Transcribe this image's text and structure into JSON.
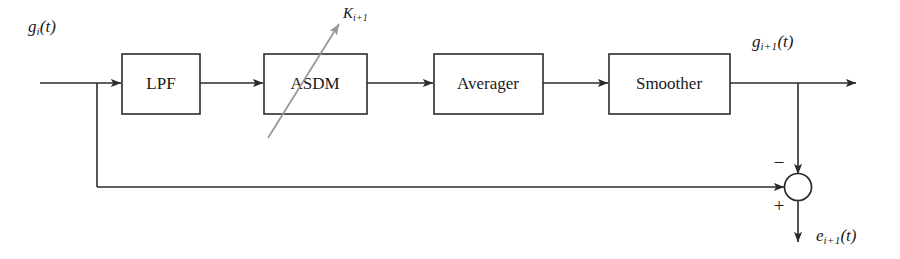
{
  "diagram": {
    "background_color": "#ffffff",
    "line_color": "#2b2b2b",
    "gain_arrow_color": "#9a9a9a",
    "blocks": [
      {
        "id": "lpf",
        "label": "LPF"
      },
      {
        "id": "asdm",
        "label": "ASDM"
      },
      {
        "id": "averager",
        "label": "Averager"
      },
      {
        "id": "smoother",
        "label": "Smoother"
      }
    ],
    "signals": {
      "input": {
        "base": "g",
        "sub": "i",
        "arg": "(t)"
      },
      "output": {
        "base": "g",
        "sub": "i+1",
        "arg": "(t)"
      },
      "error": {
        "base": "e",
        "sub": "i+1",
        "arg": "(t)"
      },
      "gain": {
        "base": "K",
        "sub": "i+1",
        "arg": ""
      }
    },
    "summing_junction": {
      "name": "summing-junction",
      "minus_sign": "−",
      "plus_sign": "+"
    }
  }
}
